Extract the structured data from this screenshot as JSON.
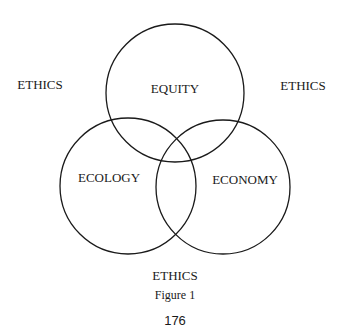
{
  "diagram": {
    "type": "venn",
    "circles": [
      {
        "label": "EQUITY",
        "cx": 175,
        "cy": 93,
        "r": 69
      },
      {
        "label": "ECOLOGY",
        "cx": 128,
        "cy": 186,
        "r": 68
      },
      {
        "label": "ECONOMY",
        "cx": 223,
        "cy": 187,
        "r": 67
      }
    ],
    "outer_labels": [
      "ETHICS",
      "ETHICS",
      "ETHICS"
    ],
    "caption": "Figure 1",
    "page_number": "176",
    "stroke_color": "#1a1a1a"
  }
}
